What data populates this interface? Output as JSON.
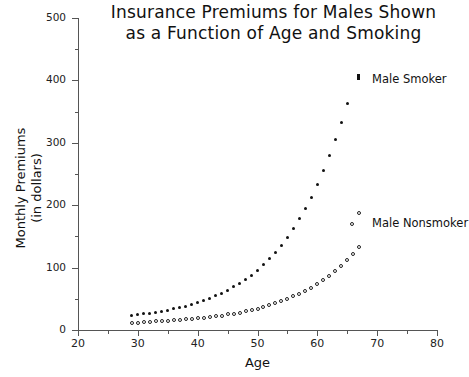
{
  "chart_data": {
    "type": "scatter",
    "title": "Insurance Premiums for Males Shown as a Function of Age and Smoking",
    "title_line1": "Insurance Premiums for Males Shown",
    "title_line2": "as a Function of Age and Smoking",
    "xlabel": "Age",
    "ylabel": "Monthly Premiums (in dollars)",
    "ylabel_line1": "Monthly Premiums",
    "ylabel_line2": "(in dollars)",
    "xlim": [
      20,
      80
    ],
    "ylim": [
      0,
      500
    ],
    "xticks": [
      20,
      30,
      40,
      50,
      60,
      70,
      80
    ],
    "yticks": [
      0,
      100,
      200,
      300,
      400,
      500
    ],
    "y_minor_ticks": [
      50,
      150,
      250,
      350,
      450
    ],
    "x_minor_ticks": [
      25,
      35,
      45,
      55,
      65,
      75
    ],
    "grid": false,
    "legend_position": "right-inside",
    "series": [
      {
        "name": "Male Smoker",
        "marker": "filled-circle",
        "color": "#111111",
        "x": [
          29,
          30,
          31,
          32,
          33,
          34,
          35,
          36,
          37,
          38,
          39,
          40,
          41,
          42,
          43,
          44,
          45,
          46,
          47,
          48,
          49,
          50,
          51,
          52,
          53,
          54,
          55,
          56,
          57,
          58,
          59,
          60,
          61,
          62,
          63,
          64,
          65
        ],
        "y": [
          24,
          25,
          26,
          27,
          28,
          30,
          32,
          34,
          36,
          38,
          41,
          44,
          47,
          51,
          55,
          59,
          64,
          69,
          75,
          81,
          88,
          96,
          105,
          114,
          125,
          136,
          149,
          163,
          178,
          195,
          213,
          233,
          255,
          279,
          305,
          333,
          363
        ]
      },
      {
        "name": "Male Nonsmoker",
        "marker": "open-circle",
        "color": "#222222",
        "x": [
          29,
          30,
          31,
          32,
          33,
          34,
          35,
          36,
          37,
          38,
          39,
          40,
          41,
          42,
          43,
          44,
          45,
          46,
          47,
          48,
          49,
          50,
          51,
          52,
          53,
          54,
          55,
          56,
          57,
          58,
          59,
          60,
          61,
          62,
          63,
          64,
          65,
          66,
          67
        ],
        "y": [
          12,
          12,
          13,
          13,
          14,
          14,
          15,
          16,
          16,
          17,
          18,
          19,
          20,
          21,
          22,
          23,
          25,
          26,
          28,
          30,
          32,
          34,
          37,
          40,
          43,
          46,
          50,
          54,
          58,
          63,
          68,
          74,
          80,
          87,
          95,
          103,
          112,
          122,
          133
        ]
      }
    ]
  },
  "legend": {
    "smoker_label": "Male Smoker",
    "nonsmoker_label": "Male Nonsmoker"
  }
}
